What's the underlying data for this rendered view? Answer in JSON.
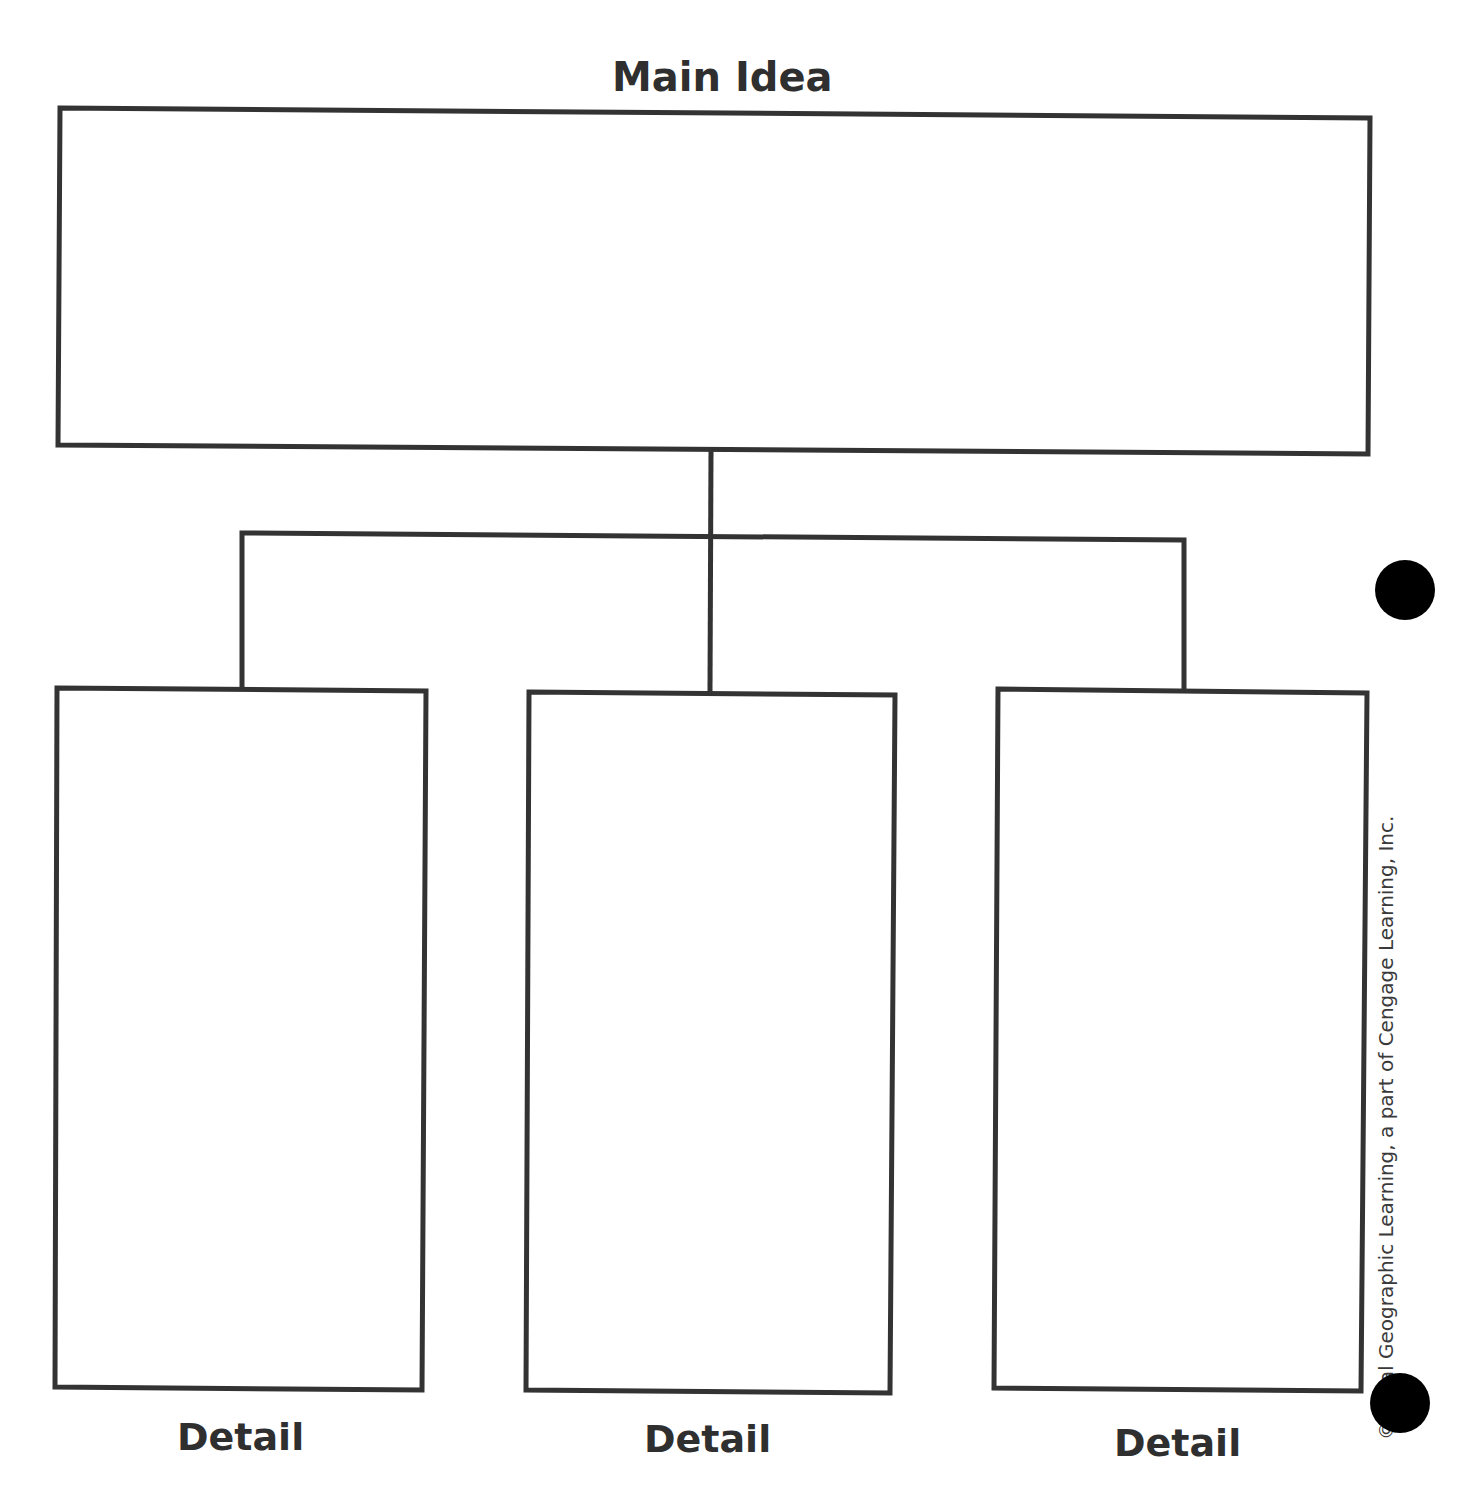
{
  "worksheet": {
    "type": "Main Idea and Details graphic organizer",
    "main_idea": {
      "label": "Main Idea",
      "content": ""
    },
    "details": [
      {
        "label": "Detail",
        "content": ""
      },
      {
        "label": "Detail",
        "content": ""
      },
      {
        "label": "Detail",
        "content": ""
      }
    ],
    "copyright": "© National Geographic Learning, a part of Cengage Learning, Inc.",
    "copyright_visible": "ional Geographic Learning, a part of Cengage Learning, Inc.",
    "copyright_symbol": "©"
  },
  "colors": {
    "line": "#333333",
    "text": "#2f2f2f",
    "punch_hole": "#000000",
    "background": "#ffffff"
  }
}
